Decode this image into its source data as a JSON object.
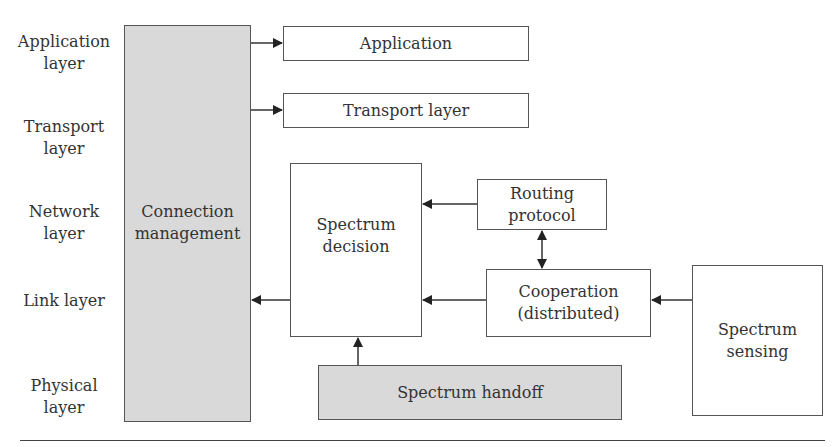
{
  "layers": [
    {
      "id": "application",
      "label": "Application\nlayer"
    },
    {
      "id": "transport",
      "label": "Transport\nlayer"
    },
    {
      "id": "network",
      "label": "Network\nlayer"
    },
    {
      "id": "link",
      "label": "Link layer"
    },
    {
      "id": "physical",
      "label": "Physical\nlayer"
    }
  ],
  "boxes": {
    "connection_management": "Connection\nmanagement",
    "application": "Application",
    "transport": "Transport layer",
    "spectrum_decision": "Spectrum\ndecision",
    "routing_protocol": "Routing\nprotocol",
    "cooperation": "Cooperation\n(distributed)",
    "spectrum_sensing": "Spectrum\nsensing",
    "spectrum_handoff": "Spectrum handoff"
  },
  "colors": {
    "shaded_box": "#d9d9d9",
    "border": "#555555",
    "text": "#333333"
  }
}
